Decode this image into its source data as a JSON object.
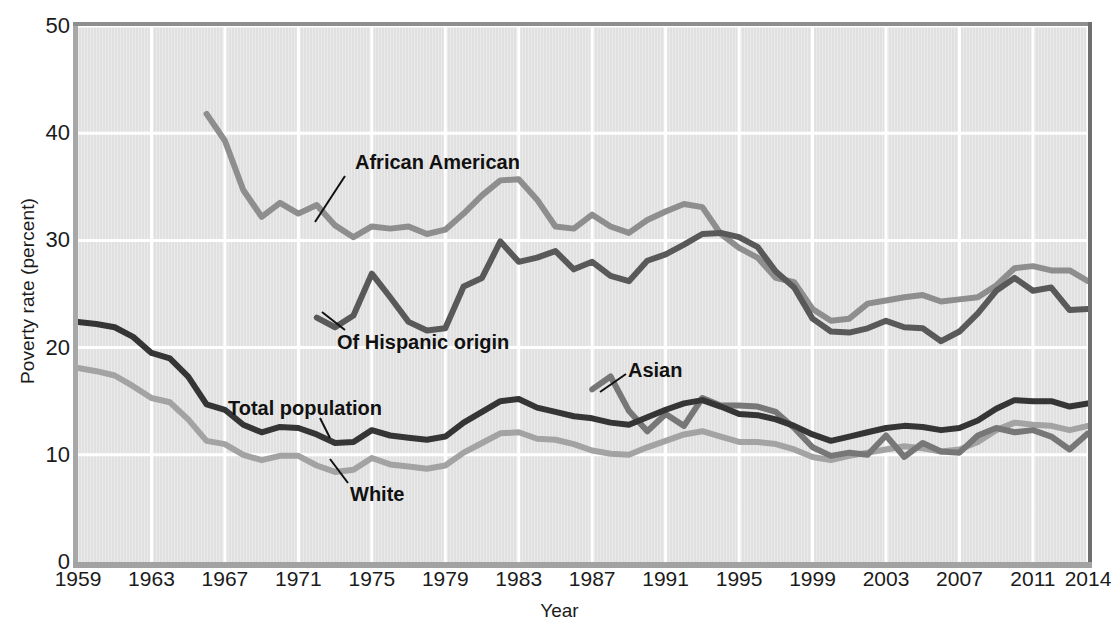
{
  "chart_data": {
    "type": "line",
    "title": "",
    "xlabel": "Year",
    "ylabel": "Poverty rate (percent)",
    "xlim": [
      1959,
      2014
    ],
    "ylim": [
      0,
      50
    ],
    "yticks": [
      0,
      10,
      20,
      30,
      40,
      50
    ],
    "xticks": [
      1959,
      1963,
      1967,
      1971,
      1975,
      1979,
      1983,
      1987,
      1991,
      1995,
      1999,
      2003,
      2007,
      2011,
      2014
    ],
    "grid": true,
    "legend_position": "inline-annotations",
    "colors": {
      "total_population": "#353535",
      "white": "#a3a3a3",
      "african_american": "#8e8e8e",
      "hispanic": "#595959",
      "asian": "#777777",
      "plot_background": "#e3e3e3",
      "gridline": "#ffffff"
    },
    "series": [
      {
        "name": "Total population",
        "color": "#353535",
        "x": [
          1959,
          1960,
          1961,
          1962,
          1963,
          1964,
          1965,
          1966,
          1967,
          1968,
          1969,
          1970,
          1971,
          1972,
          1973,
          1974,
          1975,
          1976,
          1977,
          1978,
          1979,
          1980,
          1981,
          1982,
          1983,
          1984,
          1985,
          1986,
          1987,
          1988,
          1989,
          1990,
          1991,
          1992,
          1993,
          1994,
          1995,
          1996,
          1997,
          1998,
          1999,
          2000,
          2001,
          2002,
          2003,
          2004,
          2005,
          2006,
          2007,
          2008,
          2009,
          2010,
          2011,
          2012,
          2013,
          2014
        ],
        "values": [
          22.4,
          22.2,
          21.9,
          21.0,
          19.5,
          19.0,
          17.3,
          14.7,
          14.2,
          12.8,
          12.1,
          12.6,
          12.5,
          11.9,
          11.1,
          11.2,
          12.3,
          11.8,
          11.6,
          11.4,
          11.7,
          13.0,
          14.0,
          15.0,
          15.2,
          14.4,
          14.0,
          13.6,
          13.4,
          13.0,
          12.8,
          13.5,
          14.2,
          14.8,
          15.1,
          14.5,
          13.8,
          13.7,
          13.3,
          12.7,
          11.9,
          11.3,
          11.7,
          12.1,
          12.5,
          12.7,
          12.6,
          12.3,
          12.5,
          13.2,
          14.3,
          15.1,
          15.0,
          15.0,
          14.5,
          14.8
        ]
      },
      {
        "name": "White",
        "color": "#a3a3a3",
        "x": [
          1959,
          1960,
          1961,
          1962,
          1963,
          1964,
          1965,
          1966,
          1967,
          1968,
          1969,
          1970,
          1971,
          1972,
          1973,
          1974,
          1975,
          1976,
          1977,
          1978,
          1979,
          1980,
          1981,
          1982,
          1983,
          1984,
          1985,
          1986,
          1987,
          1988,
          1989,
          1990,
          1991,
          1992,
          1993,
          1994,
          1995,
          1996,
          1997,
          1998,
          1999,
          2000,
          2001,
          2002,
          2003,
          2004,
          2005,
          2006,
          2007,
          2008,
          2009,
          2010,
          2011,
          2012,
          2013,
          2014
        ],
        "values": [
          18.1,
          17.8,
          17.4,
          16.4,
          15.3,
          14.9,
          13.3,
          11.3,
          11.0,
          10.0,
          9.5,
          9.9,
          9.9,
          9.0,
          8.4,
          8.6,
          9.7,
          9.1,
          8.9,
          8.7,
          9.0,
          10.2,
          11.1,
          12.0,
          12.1,
          11.5,
          11.4,
          11.0,
          10.4,
          10.1,
          10.0,
          10.7,
          11.3,
          11.9,
          12.2,
          11.7,
          11.2,
          11.2,
          11.0,
          10.5,
          9.8,
          9.5,
          9.9,
          10.2,
          10.5,
          10.8,
          10.6,
          10.3,
          10.5,
          11.2,
          12.3,
          13.0,
          12.8,
          12.7,
          12.3,
          12.7
        ]
      },
      {
        "name": "African American",
        "color": "#8e8e8e",
        "x": [
          1966,
          1967,
          1968,
          1969,
          1970,
          1971,
          1972,
          1973,
          1974,
          1975,
          1976,
          1977,
          1978,
          1979,
          1980,
          1981,
          1982,
          1983,
          1984,
          1985,
          1986,
          1987,
          1988,
          1989,
          1990,
          1991,
          1992,
          1993,
          1994,
          1995,
          1996,
          1997,
          1998,
          1999,
          2000,
          2001,
          2002,
          2003,
          2004,
          2005,
          2006,
          2007,
          2008,
          2009,
          2010,
          2011,
          2012,
          2013,
          2014
        ],
        "values": [
          41.8,
          39.3,
          34.7,
          32.2,
          33.5,
          32.5,
          33.3,
          31.4,
          30.3,
          31.3,
          31.1,
          31.3,
          30.6,
          31.0,
          32.5,
          34.2,
          35.6,
          35.7,
          33.8,
          31.3,
          31.1,
          32.4,
          31.3,
          30.7,
          31.9,
          32.7,
          33.4,
          33.1,
          30.6,
          29.3,
          28.4,
          26.5,
          26.1,
          23.6,
          22.5,
          22.7,
          24.1,
          24.4,
          24.7,
          24.9,
          24.3,
          24.5,
          24.7,
          25.8,
          27.4,
          27.6,
          27.2,
          27.2,
          26.2
        ]
      },
      {
        "name": "Of Hispanic origin",
        "color": "#595959",
        "x": [
          1972,
          1973,
          1974,
          1975,
          1976,
          1977,
          1978,
          1979,
          1980,
          1981,
          1982,
          1983,
          1984,
          1985,
          1986,
          1987,
          1988,
          1989,
          1990,
          1991,
          1992,
          1993,
          1994,
          1995,
          1996,
          1997,
          1998,
          1999,
          2000,
          2001,
          2002,
          2003,
          2004,
          2005,
          2006,
          2007,
          2008,
          2009,
          2010,
          2011,
          2012,
          2013,
          2014
        ],
        "values": [
          22.8,
          21.9,
          23.0,
          26.9,
          24.7,
          22.4,
          21.6,
          21.8,
          25.7,
          26.5,
          29.9,
          28.0,
          28.4,
          29.0,
          27.3,
          28.0,
          26.7,
          26.2,
          28.1,
          28.7,
          29.6,
          30.6,
          30.7,
          30.3,
          29.4,
          27.1,
          25.6,
          22.7,
          21.5,
          21.4,
          21.8,
          22.5,
          21.9,
          21.8,
          20.6,
          21.5,
          23.2,
          25.3,
          26.5,
          25.3,
          25.6,
          23.5,
          23.6
        ]
      },
      {
        "name": "Asian",
        "color": "#777777",
        "x": [
          1987,
          1988,
          1989,
          1990,
          1991,
          1992,
          1993,
          1994,
          1995,
          1996,
          1997,
          1998,
          1999,
          2000,
          2001,
          2002,
          2003,
          2004,
          2005,
          2006,
          2007,
          2008,
          2009,
          2010,
          2011,
          2012,
          2013,
          2014
        ],
        "values": [
          16.1,
          17.3,
          14.1,
          12.2,
          13.8,
          12.7,
          15.3,
          14.6,
          14.6,
          14.5,
          14.0,
          12.5,
          10.7,
          9.9,
          10.2,
          10.0,
          11.8,
          9.8,
          11.1,
          10.3,
          10.2,
          11.8,
          12.5,
          12.1,
          12.3,
          11.7,
          10.5,
          12.0
        ]
      }
    ],
    "annotations": [
      {
        "text": "African American",
        "series": "African American"
      },
      {
        "text": "Of Hispanic origin",
        "series": "Of Hispanic origin"
      },
      {
        "text": "Total population",
        "series": "Total population"
      },
      {
        "text": "White",
        "series": "White"
      },
      {
        "text": "Asian",
        "series": "Asian"
      }
    ]
  },
  "axes": {
    "ylabel": "Poverty rate (percent)",
    "xlabel": "Year",
    "ytick_labels": [
      "50",
      "40",
      "30",
      "20",
      "10",
      "0"
    ],
    "xtick_labels": [
      "1959",
      "1963",
      "1967",
      "1971",
      "1975",
      "1979",
      "1983",
      "1987",
      "1991",
      "1995",
      "1999",
      "2003",
      "2007",
      "2011",
      "2014"
    ]
  },
  "annotations": {
    "african_american": "African American",
    "hispanic": "Of Hispanic origin",
    "total_population": "Total population",
    "white": "White",
    "asian": "Asian"
  }
}
